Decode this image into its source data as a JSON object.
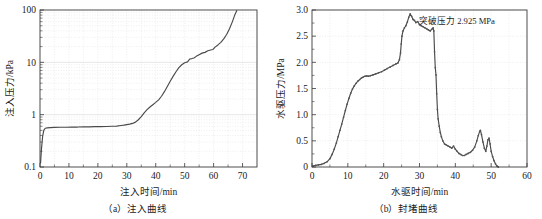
{
  "figure": {
    "panels": [
      {
        "id": "a",
        "caption": "（a）注入曲线",
        "chart_data": {
          "type": "line",
          "title": "",
          "xlabel": "注入时间/min",
          "ylabel": "注入压力/kPa",
          "yscale": "log",
          "xlim": [
            0,
            75
          ],
          "ylim": [
            0.1,
            100
          ],
          "xticks": [
            "0",
            "10",
            "20",
            "30",
            "40",
            "50",
            "60",
            "70"
          ],
          "xtick_values": [
            0,
            10,
            20,
            30,
            40,
            50,
            60,
            70
          ],
          "yticks": [
            "0.1",
            "1",
            "10",
            "100"
          ],
          "ytick_values": [
            0.1,
            1,
            10,
            100
          ],
          "grid": true,
          "legend": "none",
          "series": [
            {
              "name": "注入压力",
              "x": [
                0.2,
                0.5,
                0.9,
                1.3,
                1.8,
                2.5,
                3.5,
                5.0,
                7.0,
                9.0,
                11.0,
                13.0,
                15.0,
                17.0,
                19.0,
                21.0,
                23.0,
                25.0,
                26.5,
                28.0,
                29.0,
                30.0,
                31.0,
                32.0,
                33.0,
                34.0,
                35.0,
                36.0,
                37.0,
                38.0,
                39.0,
                40.0,
                41.0,
                42.0,
                43.0,
                44.0,
                45.0,
                46.0,
                47.0,
                48.0,
                49.0,
                50.0,
                51.0,
                51.8,
                52.5,
                53.2,
                54.0,
                55.0,
                56.0,
                57.0,
                58.0,
                59.0,
                59.8,
                60.5,
                61.5,
                62.5,
                63.5,
                64.5,
                65.5,
                66.5,
                67.3,
                68.0
              ],
              "y": [
                0.12,
                0.22,
                0.38,
                0.5,
                0.55,
                0.56,
                0.565,
                0.57,
                0.575,
                0.575,
                0.58,
                0.58,
                0.585,
                0.585,
                0.59,
                0.59,
                0.595,
                0.6,
                0.605,
                0.62,
                0.63,
                0.645,
                0.66,
                0.68,
                0.72,
                0.8,
                0.92,
                1.08,
                1.25,
                1.4,
                1.55,
                1.72,
                1.92,
                2.25,
                2.75,
                3.45,
                4.35,
                5.4,
                6.6,
                7.9,
                9.0,
                9.8,
                10.2,
                11.6,
                11.8,
                12.1,
                13.0,
                14.0,
                15.0,
                15.5,
                16.6,
                17.2,
                17.6,
                19.5,
                21.5,
                24.0,
                28.0,
                34.0,
                44.0,
                60.0,
                80.0,
                97.0
              ]
            }
          ]
        }
      },
      {
        "id": "b",
        "caption": "（b）封堵曲线",
        "annotation": "突破压力 2.925 MPa",
        "chart_data": {
          "type": "line",
          "title": "",
          "xlabel": "水驱时间/min",
          "ylabel": "水驱压力/MPa",
          "yscale": "linear",
          "xlim": [
            0,
            60
          ],
          "ylim": [
            0,
            3.0
          ],
          "xticks": [
            "0",
            "10",
            "20",
            "30",
            "40",
            "50",
            "60"
          ],
          "xtick_values": [
            0,
            10,
            20,
            30,
            40,
            50,
            60
          ],
          "yticks": [
            "0",
            "0.5",
            "1.0",
            "1.5",
            "2.0",
            "2.5",
            "3.0"
          ],
          "ytick_values": [
            0,
            0.5,
            1.0,
            1.5,
            2.0,
            2.5,
            3.0
          ],
          "grid": true,
          "legend": "none",
          "breakthrough_pressure": 2.925,
          "breakthrough_unit": "MPa",
          "series": [
            {
              "name": "水驱压力",
              "x": [
                0.3,
                1.0,
                1.8,
                2.6,
                3.4,
                4.2,
                5.0,
                5.6,
                6.2,
                6.8,
                7.3,
                7.8,
                8.3,
                8.8,
                9.3,
                9.8,
                10.3,
                10.8,
                11.3,
                11.8,
                12.3,
                12.8,
                13.3,
                13.8,
                14.3,
                14.8,
                15.3,
                15.8,
                16.3,
                17.0,
                17.8,
                18.6,
                19.4,
                20.2,
                21.0,
                21.8,
                22.6,
                23.4,
                24.0,
                24.4,
                24.7,
                24.9,
                25.1,
                25.4,
                25.8,
                26.2,
                26.6,
                27.0,
                27.4,
                27.8,
                28.2,
                28.6,
                29.0,
                29.5,
                30.0,
                30.5,
                31.0,
                31.5,
                32.0,
                32.5,
                33.0,
                33.4,
                33.8,
                34.0,
                34.2,
                34.4,
                34.6,
                34.8,
                35.0,
                35.2,
                35.5,
                35.8,
                36.1,
                36.5,
                37.0,
                37.5,
                38.0,
                38.5,
                39.0,
                39.5,
                40.0,
                40.5,
                41.0,
                41.5,
                42.0,
                42.5,
                43.0,
                43.6,
                44.2,
                44.8,
                45.4,
                46.0,
                46.4,
                46.8,
                47.0,
                47.3,
                47.7,
                48.1,
                48.5,
                48.8,
                49.1,
                49.4,
                49.7,
                50.0,
                50.4,
                50.8,
                51.2,
                51.6,
                52.0
              ],
              "y": [
                0.02,
                0.03,
                0.04,
                0.05,
                0.07,
                0.1,
                0.16,
                0.24,
                0.34,
                0.46,
                0.58,
                0.7,
                0.82,
                0.95,
                1.08,
                1.2,
                1.31,
                1.41,
                1.49,
                1.55,
                1.6,
                1.64,
                1.67,
                1.7,
                1.72,
                1.735,
                1.74,
                1.735,
                1.745,
                1.76,
                1.78,
                1.8,
                1.82,
                1.85,
                1.88,
                1.91,
                1.94,
                1.97,
                1.99,
                2.05,
                2.18,
                2.35,
                2.5,
                2.6,
                2.66,
                2.7,
                2.77,
                2.86,
                2.925,
                2.88,
                2.82,
                2.8,
                2.76,
                2.78,
                2.72,
                2.7,
                2.68,
                2.66,
                2.64,
                2.62,
                2.6,
                2.63,
                2.66,
                2.6,
                2.2,
                1.9,
                1.76,
                1.4,
                1.1,
                0.92,
                0.78,
                0.66,
                0.58,
                0.5,
                0.44,
                0.42,
                0.4,
                0.38,
                0.36,
                0.4,
                0.34,
                0.3,
                0.26,
                0.24,
                0.22,
                0.22,
                0.24,
                0.26,
                0.28,
                0.32,
                0.38,
                0.5,
                0.6,
                0.68,
                0.7,
                0.62,
                0.48,
                0.36,
                0.3,
                0.4,
                0.52,
                0.55,
                0.44,
                0.3,
                0.2,
                0.12,
                0.06,
                0.02,
                0.0
              ]
            }
          ]
        }
      }
    ]
  }
}
